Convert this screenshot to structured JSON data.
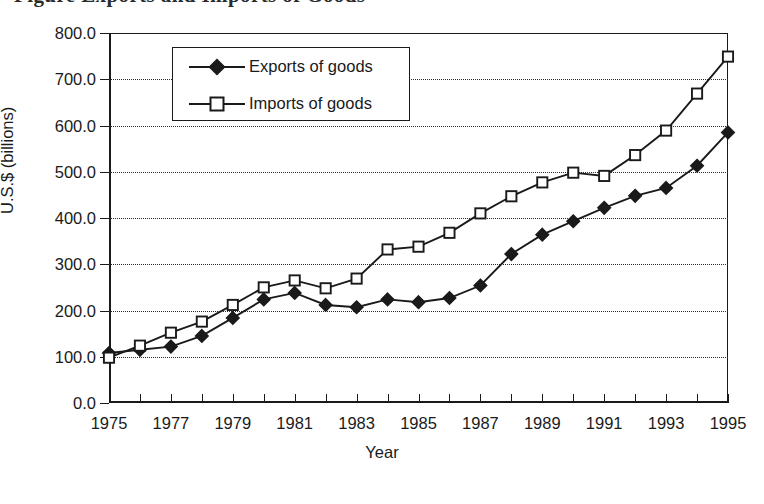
{
  "clipped_header_text": "Figure  Exports and Imports of Goods",
  "chart_data": {
    "type": "line",
    "title": "",
    "xlabel": "Year",
    "ylabel": "U.S.$ (billions)",
    "x": [
      1975,
      1976,
      1977,
      1978,
      1979,
      1980,
      1981,
      1982,
      1983,
      1984,
      1985,
      1986,
      1987,
      1988,
      1989,
      1990,
      1991,
      1992,
      1993,
      1994,
      1995
    ],
    "xlim": [
      1975,
      1995
    ],
    "ylim": [
      0,
      800
    ],
    "ytick_labels": [
      "0.0",
      "100.0",
      "200.0",
      "300.0",
      "400.0",
      "500.0",
      "600.0",
      "700.0",
      "800.0"
    ],
    "ytick_values": [
      0,
      100,
      200,
      300,
      400,
      500,
      600,
      700,
      800
    ],
    "xtick_labels": [
      "1975",
      "1977",
      "1979",
      "1981",
      "1983",
      "1985",
      "1987",
      "1989",
      "1991",
      "1993",
      "1995"
    ],
    "xtick_values": [
      1975,
      1977,
      1979,
      1981,
      1983,
      1985,
      1987,
      1989,
      1991,
      1993,
      1995
    ],
    "xtick_minor_values": [
      1976,
      1978,
      1980,
      1982,
      1984,
      1986,
      1988,
      1990,
      1992,
      1994
    ],
    "grid": "horizontal-dotted",
    "legend_position": "upper-left-inside",
    "series": [
      {
        "name": "Exports of goods",
        "marker": "filled-diamond",
        "color": "#1a1a1a",
        "values": [
          108,
          115,
          122,
          145,
          184,
          224,
          238,
          212,
          207,
          224,
          218,
          227,
          254,
          322,
          364,
          393,
          422,
          448,
          465,
          513,
          585
        ]
      },
      {
        "name": "Imports of goods",
        "marker": "open-square",
        "color": "#1a1a1a",
        "values": [
          98,
          124,
          152,
          176,
          212,
          250,
          265,
          248,
          269,
          332,
          338,
          368,
          410,
          447,
          477,
          498,
          491,
          536,
          589,
          669,
          749
        ]
      }
    ]
  }
}
